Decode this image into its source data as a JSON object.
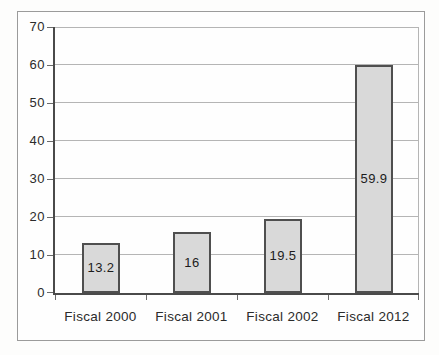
{
  "chart_data": {
    "type": "bar",
    "categories": [
      "Fiscal 2000",
      "Fiscal 2001",
      "Fiscal 2002",
      "Fiscal 2012"
    ],
    "values": [
      13.2,
      16,
      19.5,
      59.9
    ],
    "value_labels": [
      "13.2",
      "16",
      "19.5",
      "59.9"
    ],
    "title": "",
    "xlabel": "",
    "ylabel": "",
    "ylim": [
      0,
      70
    ],
    "yticks": [
      0,
      10,
      20,
      30,
      40,
      50,
      60,
      70
    ],
    "grid": true,
    "legend": "none",
    "value_label_position": "inside-center",
    "colors": {
      "bar_fill": "#d9d9d9",
      "bar_border": "#4f4f4f",
      "gridline": "#b5b5b5",
      "axis": "#4a4a4a",
      "frame_border": "#9b9b9b",
      "tick": "#6a6a6a",
      "axis_label_text": "#2b2b2b",
      "value_label_text": "#1c1c1c",
      "background": "#ffffff"
    }
  }
}
